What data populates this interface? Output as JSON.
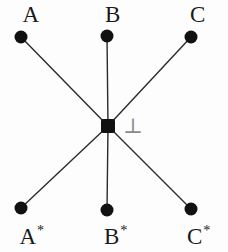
{
  "figure": {
    "type": "node-link-diagram",
    "width": 228,
    "height": 252,
    "background_color": "#fdfdfd",
    "edge_color": "#2b2b2b",
    "node_color": "#111111",
    "annotation_color": "#8a8a8a"
  },
  "nodes": [
    {
      "id": "A",
      "label": "A",
      "superscript": "",
      "x": 21,
      "y": 37,
      "shape": "circle",
      "label_x": 31,
      "label_y": 14
    },
    {
      "id": "B",
      "label": "B",
      "superscript": "",
      "x": 107,
      "y": 36,
      "shape": "circle",
      "label_x": 113,
      "label_y": 14
    },
    {
      "id": "C",
      "label": "C",
      "superscript": "",
      "x": 191,
      "y": 37,
      "shape": "circle",
      "label_x": 198,
      "label_y": 14
    },
    {
      "id": "O",
      "label": "",
      "superscript": "",
      "x": 108,
      "y": 126,
      "shape": "square",
      "label_x": 0,
      "label_y": 0
    },
    {
      "id": "As",
      "label": "A",
      "superscript": "*",
      "x": 21,
      "y": 208,
      "shape": "circle",
      "label_x": 32,
      "label_y": 236
    },
    {
      "id": "Bs",
      "label": "B",
      "superscript": "*",
      "x": 107,
      "y": 210,
      "shape": "circle",
      "label_x": 116,
      "label_y": 236
    },
    {
      "id": "Cs",
      "label": "C",
      "superscript": "*",
      "x": 191,
      "y": 209,
      "shape": "circle",
      "label_x": 199,
      "label_y": 236
    }
  ],
  "edges": [
    {
      "from": "O",
      "to": "A"
    },
    {
      "from": "O",
      "to": "B"
    },
    {
      "from": "O",
      "to": "C"
    },
    {
      "from": "O",
      "to": "As"
    },
    {
      "from": "O",
      "to": "Bs"
    },
    {
      "from": "O",
      "to": "Cs"
    }
  ],
  "annotation": {
    "symbol": "⊥",
    "name": "perpendicular-symbol",
    "x": 133,
    "y": 126
  }
}
